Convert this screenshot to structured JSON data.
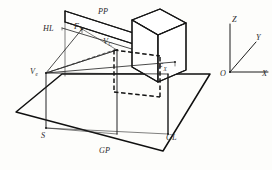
{
  "figure": {
    "kind": "technical-line-drawing",
    "background_color": "#fdfdfb",
    "ink_color": "#1d1d1d"
  },
  "labels": {
    "picture_plane": "PP",
    "horizon_line": "HL",
    "vanishing_point_y": {
      "base": "F",
      "sub": "Y"
    },
    "center_of_vision": {
      "base": "V",
      "sub": "C"
    },
    "eye_point": {
      "base": "V",
      "sub": "e"
    },
    "vanishing_point_x": {
      "base": "F",
      "sub": "X"
    },
    "station_point": "S",
    "ground_plane": "GP",
    "ground_line": "GL"
  },
  "axes": {
    "origin": "O",
    "x": "X",
    "y": "Y",
    "z": "Z"
  }
}
